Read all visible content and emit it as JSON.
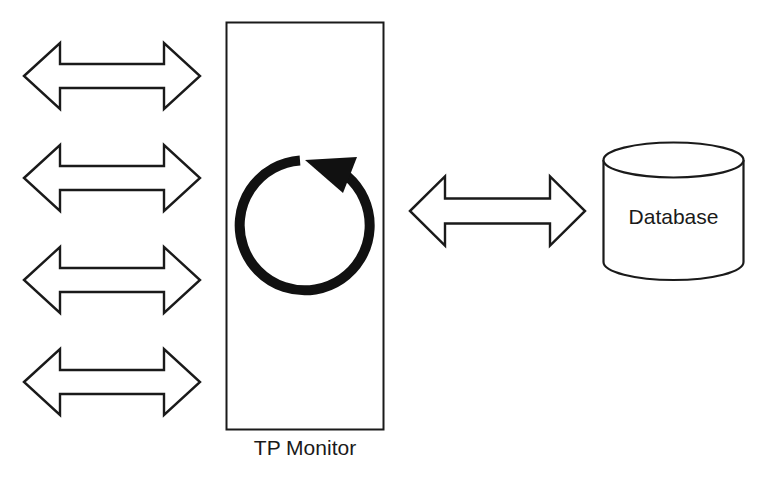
{
  "diagram": {
    "type": "architecture",
    "title": "",
    "nodes": [
      {
        "id": "tp-monitor",
        "label": "TP Monitor",
        "shape": "rectangle",
        "contains": "cycle-arrow"
      },
      {
        "id": "database",
        "label": "Database",
        "shape": "cylinder"
      }
    ],
    "client_arrows": 4,
    "edges": [
      {
        "from": "client-1",
        "to": "tp-monitor",
        "style": "double-headed hollow arrow"
      },
      {
        "from": "client-2",
        "to": "tp-monitor",
        "style": "double-headed hollow arrow"
      },
      {
        "from": "client-3",
        "to": "tp-monitor",
        "style": "double-headed hollow arrow"
      },
      {
        "from": "client-4",
        "to": "tp-monitor",
        "style": "double-headed hollow arrow"
      },
      {
        "from": "tp-monitor",
        "to": "database",
        "style": "double-headed hollow arrow"
      }
    ],
    "colors": {
      "stroke": "#1a1a1a",
      "fill": "#ffffff"
    }
  },
  "labels": {
    "tp_monitor": "TP Monitor",
    "database": "Database"
  }
}
